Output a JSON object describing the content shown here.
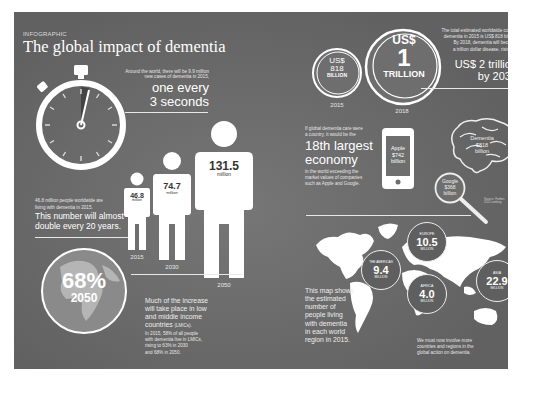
{
  "header": {
    "kicker": "INFOGRAPHIC",
    "title": "The global impact of dementia"
  },
  "new_cases": {
    "intro_line1": "Around the world, there will be 9.9 million",
    "intro_line2": "new cases of dementia in 2015,",
    "headline_line1": "one every",
    "headline_line2": "3 seconds",
    "icon": "stopwatch-icon"
  },
  "prevalence": {
    "intro_line1": "46.8 million people worldwide are",
    "intro_line2": "living with dementia in 2015.",
    "headline_line1": "This number will almost",
    "headline_line2": "double every 20 years.",
    "figures": [
      {
        "value": "46.8",
        "unit": "million",
        "year": "2015"
      },
      {
        "value": "74.7",
        "unit": "million",
        "year": "2030"
      },
      {
        "value": "131.5",
        "unit": "million",
        "year": "2050"
      }
    ]
  },
  "lmic": {
    "percent": "68%",
    "year": "2050",
    "headline_line1": "Much of the increase",
    "headline_line2": "will take place in low",
    "headline_line3": "and middle income",
    "headline_line4": "countries",
    "abbr": "(LMICs).",
    "detail_line1": "In 2015, 58% of all people",
    "detail_line2": "with dementia live in LMICs,",
    "detail_line3": "rising to 63% in 2030",
    "detail_line4": "and 68% in 2050."
  },
  "cost": {
    "coins": [
      {
        "line1": "US$",
        "line2": "818",
        "line3": "BILLION",
        "year": "2015"
      },
      {
        "line1": "US$",
        "line2": "1",
        "line3": "TRILLION",
        "year": "2018"
      }
    ],
    "intro_line1": "The total estimated worldwide cost of",
    "intro_line2": "dementia in 2015 is US$ 818 billion.",
    "intro_line3": "By 2018, dementia will become",
    "intro_line4": "a trillion dollar disease, rising to",
    "headline_line1": "US$ 2 trillion",
    "headline_line2": "by 2030"
  },
  "economy": {
    "intro_line1": "If global dementia care were",
    "intro_line2": "a country, it would be the",
    "headline_line1": "18th largest",
    "headline_line2": "economy",
    "detail_line1": "in the world exceeding the",
    "detail_line2": "market values of companies",
    "detail_line3": "such as Apple and Google.",
    "apple": {
      "line1": "Apple",
      "line2": "$742",
      "line3": "billion"
    },
    "dementia": {
      "line1": "Dementia",
      "line2": "$818",
      "line3": "billion"
    },
    "google": {
      "line1": "Google",
      "line2": "$368",
      "line3": "billion"
    },
    "source": "Source: Forbes 2015 ranking"
  },
  "map": {
    "caption_line1": "This map shows",
    "caption_line2": "the estimated",
    "caption_line3": "number of",
    "caption_line4": "people living",
    "caption_line5": "with dementia",
    "caption_line6": "in each world",
    "caption_line7": "region in 2015.",
    "regions": [
      {
        "name": "THE AMERICAS",
        "value": "9.4",
        "unit": "MILLION"
      },
      {
        "name": "EUROPE",
        "value": "10.5",
        "unit": "MILLION"
      },
      {
        "name": "AFRICA",
        "value": "4.0",
        "unit": "MILLION"
      },
      {
        "name": "ASIA",
        "value": "22.9",
        "unit": "MILLION"
      }
    ],
    "footer_line1": "We must now involve more",
    "footer_line2": "countries and regions in the",
    "footer_line3": "global action on dementia."
  },
  "colors": {
    "panel": "#6e6e6e",
    "text": "#ffffff",
    "badge": "#5f5f5f"
  }
}
